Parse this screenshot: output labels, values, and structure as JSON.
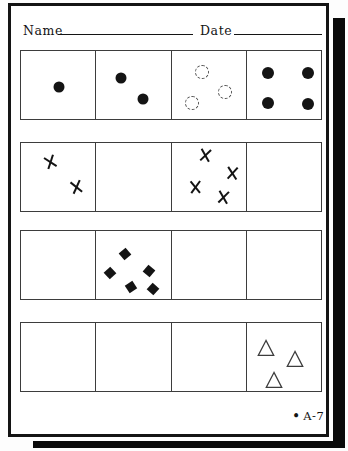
{
  "header": {
    "name_label": "Name",
    "date_label": "Date"
  },
  "footer": {
    "bullet": "•",
    "label": "A-7"
  },
  "colors": {
    "ink": "#141414",
    "line": "#3d3d3d",
    "dashed": "#4f4f4f",
    "paper": "#ffffff",
    "shadow": "#0a0a0a"
  },
  "grids": [
    {
      "cells": [
        {
          "shapes": [
            {
              "type": "dot",
              "x": 38,
              "y": 36,
              "s": 11
            }
          ]
        },
        {
          "shapes": [
            {
              "type": "dot",
              "x": 25,
              "y": 27,
              "s": 11
            },
            {
              "type": "dot",
              "x": 47,
              "y": 48,
              "s": 11
            }
          ]
        },
        {
          "shapes": [
            {
              "type": "dashed-circle",
              "x": 30,
              "y": 21,
              "s": 14
            },
            {
              "type": "dashed-circle",
              "x": 53,
              "y": 41,
              "s": 14
            },
            {
              "type": "dashed-circle",
              "x": 20,
              "y": 52,
              "s": 14
            }
          ]
        },
        {
          "shapes": [
            {
              "type": "dot",
              "x": 21,
              "y": 22,
              "s": 12
            },
            {
              "type": "dot",
              "x": 61,
              "y": 22,
              "s": 12
            },
            {
              "type": "dot",
              "x": 21,
              "y": 52,
              "s": 12
            },
            {
              "type": "dot",
              "x": 61,
              "y": 53,
              "s": 12
            }
          ]
        }
      ]
    },
    {
      "cells": [
        {
          "shapes": [
            {
              "type": "x-mark",
              "x": 29,
              "y": 19,
              "s": 12,
              "r": -24
            },
            {
              "type": "x-mark",
              "x": 55,
              "y": 44,
              "s": 12,
              "r": -18
            }
          ]
        },
        {
          "shapes": []
        },
        {
          "shapes": [
            {
              "type": "x-mark",
              "x": 33,
              "y": 12,
              "s": 12,
              "r": 4
            },
            {
              "type": "x-mark",
              "x": 61,
              "y": 30,
              "s": 12,
              "r": 0
            },
            {
              "type": "x-mark",
              "x": 23,
              "y": 44,
              "s": 12,
              "r": -6
            },
            {
              "type": "x-mark",
              "x": 51,
              "y": 54,
              "s": 12,
              "r": 3
            }
          ]
        },
        {
          "shapes": []
        }
      ]
    },
    {
      "cells": [
        {
          "shapes": []
        },
        {
          "shapes": [
            {
              "type": "diamond",
              "x": 29,
              "y": 23,
              "s": 9,
              "r": 50
            },
            {
              "type": "diamond",
              "x": 53,
              "y": 40,
              "s": 9,
              "r": 40
            },
            {
              "type": "diamond",
              "x": 14,
              "y": 42,
              "s": 9,
              "r": 47
            },
            {
              "type": "diamond",
              "x": 35,
              "y": 56,
              "s": 9,
              "r": 57
            },
            {
              "type": "diamond",
              "x": 57,
              "y": 58,
              "s": 9,
              "r": 42
            }
          ]
        },
        {
          "shapes": []
        },
        {
          "shapes": []
        }
      ]
    },
    {
      "cells": [
        {
          "shapes": []
        },
        {
          "shapes": []
        },
        {
          "shapes": []
        },
        {
          "shapes": [
            {
              "type": "triangle",
              "x": 19,
              "y": 25,
              "s": 18
            },
            {
              "type": "triangle",
              "x": 48,
              "y": 36,
              "s": 18
            },
            {
              "type": "triangle",
              "x": 27,
              "y": 57,
              "s": 18
            }
          ]
        }
      ]
    }
  ]
}
